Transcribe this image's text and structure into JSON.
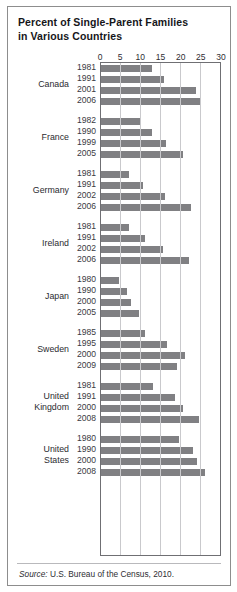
{
  "title": {
    "line1": "Percent of Single-Parent Families",
    "line2": "in Various Countries"
  },
  "source": {
    "label": "Source:",
    "text": " U.S. Bureau of the Census, 2010."
  },
  "colors": {
    "bar": "#808083",
    "gridline": "#c9c9cc",
    "axis": "#6f6f73",
    "frame": "#8d8d8d",
    "text": "#2b2b30",
    "background": "#ffffff"
  },
  "chart_data": {
    "type": "bar",
    "orientation": "horizontal",
    "title": "Percent of Single-Parent Families in Various Countries",
    "xlabel": "",
    "ylabel": "",
    "xlim": [
      0,
      30
    ],
    "xticks": [
      0,
      5,
      10,
      15,
      20,
      25,
      30
    ],
    "ticklabels": [
      "0",
      "5",
      "10",
      "15",
      "20",
      "25",
      "30"
    ],
    "grid": true,
    "legend": false,
    "units": "percent",
    "groups": [
      {
        "country": "Canada",
        "country_lines": [
          "Canada"
        ],
        "rows": [
          {
            "year": "1981",
            "value": 12.8
          },
          {
            "year": "1991",
            "value": 15.8
          },
          {
            "year": "2001",
            "value": 23.8
          },
          {
            "year": "2006",
            "value": 25.0
          }
        ]
      },
      {
        "country": "France",
        "country_lines": [
          "France"
        ],
        "rows": [
          {
            "year": "1982",
            "value": 10.0
          },
          {
            "year": "1990",
            "value": 12.8
          },
          {
            "year": "1999",
            "value": 16.3
          },
          {
            "year": "2005",
            "value": 20.5
          }
        ]
      },
      {
        "country": "Germany",
        "country_lines": [
          "Germany"
        ],
        "rows": [
          {
            "year": "1981",
            "value": 7.0
          },
          {
            "year": "1991",
            "value": 10.5
          },
          {
            "year": "2002",
            "value": 16.0
          },
          {
            "year": "2006",
            "value": 22.5
          }
        ]
      },
      {
        "country": "Ireland",
        "country_lines": [
          "Ireland"
        ],
        "rows": [
          {
            "year": "1981",
            "value": 7.0
          },
          {
            "year": "1991",
            "value": 11.0
          },
          {
            "year": "2002",
            "value": 15.5
          },
          {
            "year": "2006",
            "value": 22.0
          }
        ]
      },
      {
        "country": "Japan",
        "country_lines": [
          "Japan"
        ],
        "rows": [
          {
            "year": "1980",
            "value": 4.5
          },
          {
            "year": "1990",
            "value": 6.5
          },
          {
            "year": "2000",
            "value": 7.5
          },
          {
            "year": "2005",
            "value": 9.5
          }
        ]
      },
      {
        "country": "Sweden",
        "country_lines": [
          "Sweden"
        ],
        "rows": [
          {
            "year": "1985",
            "value": 11.0
          },
          {
            "year": "1995",
            "value": 16.5
          },
          {
            "year": "2000",
            "value": 21.0
          },
          {
            "year": "2009",
            "value": 19.0
          }
        ]
      },
      {
        "country": "United Kingdom",
        "country_lines": [
          "United",
          "Kingdom"
        ],
        "rows": [
          {
            "year": "1981",
            "value": 13.0
          },
          {
            "year": "1991",
            "value": 18.5
          },
          {
            "year": "2000",
            "value": 20.5
          },
          {
            "year": "2008",
            "value": 24.5
          }
        ]
      },
      {
        "country": "United States",
        "country_lines": [
          "United",
          "States"
        ],
        "rows": [
          {
            "year": "1980",
            "value": 19.5
          },
          {
            "year": "1990",
            "value": 23.0
          },
          {
            "year": "2000",
            "value": 24.0
          },
          {
            "year": "2008",
            "value": 26.0
          }
        ]
      }
    ]
  }
}
